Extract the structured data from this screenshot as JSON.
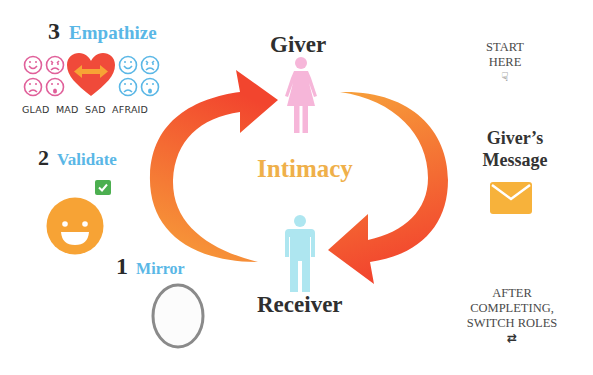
{
  "steps": {
    "empathize": {
      "number": "3",
      "label": "Empathize"
    },
    "validate": {
      "number": "2",
      "label": "Validate"
    },
    "mirror": {
      "number": "1",
      "label": "Mirror"
    }
  },
  "emotions": [
    "GLAD",
    "MAD",
    "SAD",
    "AFRAID"
  ],
  "roles": {
    "giver": "Giver",
    "receiver": "Receiver"
  },
  "center": {
    "label": "Intimacy"
  },
  "start": {
    "line1": "START",
    "line2": "HERE"
  },
  "message": {
    "line1": "Giver’s",
    "line2": "Message"
  },
  "after": {
    "line1": "AFTER",
    "line2": "COMPLETING,",
    "line3": "SWITCH ROLES"
  },
  "colors": {
    "step_label": "#5ab7e6",
    "pink": "#e0609a",
    "blue": "#5ab7e6",
    "heart": "#f04a3a",
    "orange": "#f7a335",
    "arrow_start": "#f7a13a",
    "arrow_end": "#f2452e",
    "giver_figure": "#f6b6d9",
    "receiver_figure": "#aee6f0",
    "intimacy": "#efb04a",
    "check": "#4caf50"
  }
}
